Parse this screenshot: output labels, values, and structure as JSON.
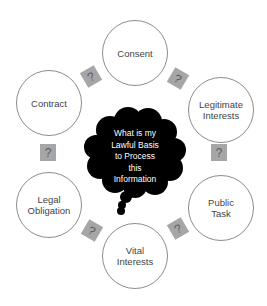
{
  "diagram": {
    "center_question": [
      "What is my",
      "Lawful Basis",
      "to Process",
      "this",
      "Information"
    ],
    "bases": [
      {
        "label": "Consent"
      },
      {
        "label": "Legitimate Interests"
      },
      {
        "label": "Public Task"
      },
      {
        "label": "Vital Interests"
      },
      {
        "label": "Legal Obligation"
      },
      {
        "label": "Contract"
      }
    ],
    "connector_glyph": "?",
    "colors": {
      "cloud": "#000000",
      "circle_border": "#8c8c8c",
      "connector_fill": "#a6a6a6"
    }
  }
}
